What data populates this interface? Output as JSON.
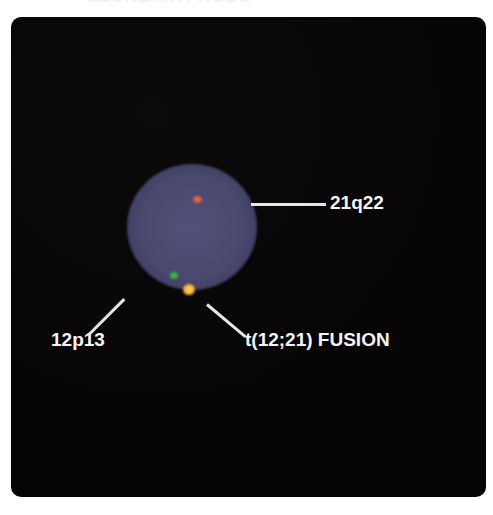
{
  "figure": {
    "clipped_title": "LEUKEMIA PROBE",
    "background_color": "#070506",
    "nucleus_color": "#4a4a70",
    "signals": [
      {
        "name": "21q22",
        "color": "#d8643a",
        "kind": "red"
      },
      {
        "name": "12p13",
        "color": "#33b43f",
        "kind": "green"
      },
      {
        "name": "t(12;21) FUSION",
        "color": "#f7b030",
        "kind": "yellow-fusion"
      }
    ],
    "labels": {
      "red_signal": "21q22",
      "green_signal": "12p13",
      "fusion_signal": "t(12;21) FUSION"
    }
  }
}
